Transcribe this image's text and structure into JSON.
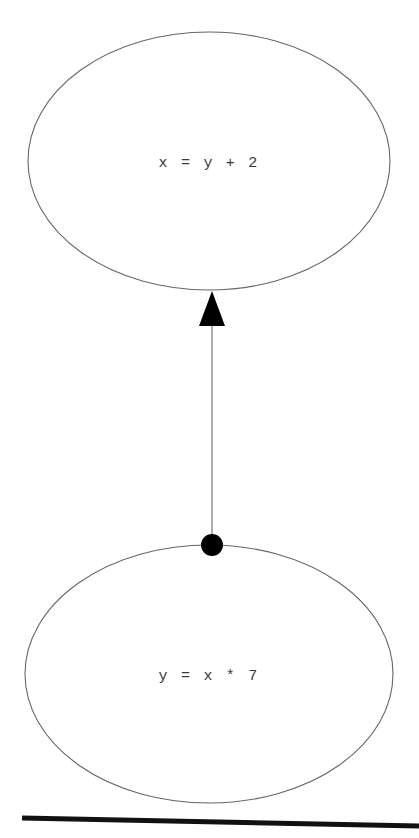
{
  "diagram": {
    "type": "directed-graph",
    "background_color": "#ffffff",
    "nodes": [
      {
        "id": "node-top",
        "label": "x = y + 2",
        "shape": "ellipse",
        "cx": 209,
        "cy": 161,
        "rx": 181,
        "ry": 129,
        "stroke_color": "#666666",
        "fill_color": "#ffffff",
        "text_color": "#3a3a3a"
      },
      {
        "id": "node-bottom",
        "label": "y = x * 7",
        "shape": "ellipse",
        "cx": 209,
        "cy": 674,
        "rx": 184,
        "ry": 129,
        "stroke_color": "#666666",
        "fill_color": "#ffffff",
        "text_color": "#3a3a3a"
      }
    ],
    "edges": [
      {
        "id": "edge-bottom-to-top",
        "from": "node-bottom",
        "to": "node-top",
        "direction": "up",
        "line_color": "#777777",
        "source_marker": "filled-circle",
        "target_marker": "filled-triangle",
        "marker_color": "#000000",
        "x": 212,
        "y_start": 545,
        "y_end": 292
      }
    ],
    "rules": [
      {
        "id": "bottom-rule",
        "color": "#111111",
        "thickness": 5,
        "x1": 22,
        "y1": 818,
        "x2": 419,
        "y2": 826
      }
    ]
  }
}
